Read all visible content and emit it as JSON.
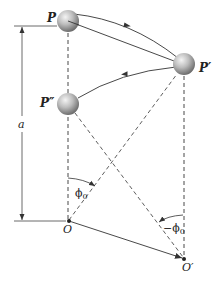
{
  "figure": {
    "labels": {
      "P": "P",
      "P_prime": "P′",
      "P_double_prime": "P″",
      "O": "O",
      "O_prime": "O′",
      "a": "a",
      "phi0": "ϕ",
      "phi0_sub": "0",
      "neg_phi0": "−ϕ",
      "neg_phi0_sub": "0"
    },
    "colors": {
      "line": "#333333",
      "sphere_light": "#f2f2f2",
      "sphere_dark": "#6e6e6e",
      "background": "#ffffff"
    }
  }
}
